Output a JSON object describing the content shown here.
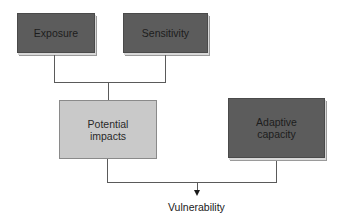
{
  "diagram": {
    "nodes": [
      {
        "id": "exposure",
        "label": "Exposure",
        "style": "dark"
      },
      {
        "id": "sensitivity",
        "label": "Sensitivity",
        "style": "dark"
      },
      {
        "id": "potential_impacts",
        "label_line1": "Potential",
        "label_line2": "impacts",
        "style": "light"
      },
      {
        "id": "adaptive_capacity",
        "label_line1": "Adaptive",
        "label_line2": "capacity",
        "style": "dark"
      }
    ],
    "output": {
      "label": "Vulnerability"
    },
    "edges": [
      {
        "from": [
          "exposure",
          "sensitivity"
        ],
        "to": "potential_impacts"
      },
      {
        "from": [
          "potential_impacts",
          "adaptive_capacity"
        ],
        "to": "vulnerability"
      }
    ],
    "colors": {
      "dark_box": "#5c5c5c",
      "light_box": "#c9c9c9",
      "connector": "#5a5a5a"
    }
  }
}
